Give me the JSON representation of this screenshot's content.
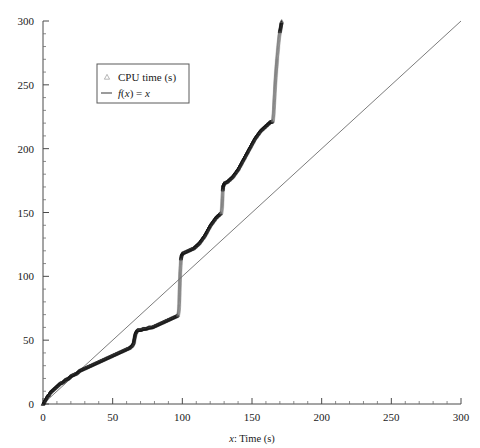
{
  "figure": {
    "background": "#ffffff",
    "plot_frame": {
      "left": 43,
      "right": 461,
      "top": 21,
      "bottom": 404
    }
  },
  "chart_data": {
    "type": "scatter",
    "title": "",
    "xlabel": "x: Time (s)",
    "ylabel": "",
    "xlim": [
      0,
      300
    ],
    "ylim": [
      0,
      300
    ],
    "xticks": [
      0,
      50,
      100,
      150,
      200,
      250,
      300
    ],
    "yticks": [
      0,
      50,
      100,
      150,
      200,
      250,
      300
    ],
    "xtick_labels": [
      "0",
      "50",
      "100",
      "150",
      "200",
      "250",
      "300"
    ],
    "ytick_labels": [
      "0",
      "50",
      "100",
      "150",
      "200",
      "250",
      "300"
    ],
    "minor_tick_step": 10,
    "grid": false,
    "legend_position": "upper left",
    "legend": [
      {
        "label": "CPU time (s)",
        "marker": "triangle",
        "color": "#6e6e6e"
      },
      {
        "label": "f(x) = x",
        "marker": "line",
        "color": "#4a4a4a"
      }
    ],
    "series": [
      {
        "name": "CPU time (s)",
        "marker": "triangle",
        "color": "#1a1a1a",
        "comment": "Staircase: slow accumulating segments separated by near-vertical jumps",
        "points": [
          [
            0,
            0
          ],
          [
            1,
            2
          ],
          [
            2,
            4
          ],
          [
            3,
            6
          ],
          [
            4,
            7
          ],
          [
            5,
            9
          ],
          [
            6,
            10
          ],
          [
            7,
            11
          ],
          [
            8,
            12
          ],
          [
            9,
            13
          ],
          [
            10,
            14
          ],
          [
            12,
            16
          ],
          [
            14,
            17
          ],
          [
            16,
            19
          ],
          [
            18,
            20
          ],
          [
            20,
            22
          ],
          [
            22,
            23
          ],
          [
            24,
            24
          ],
          [
            26,
            26
          ],
          [
            28,
            27
          ],
          [
            30,
            28
          ],
          [
            32,
            29
          ],
          [
            34,
            30
          ],
          [
            36,
            31
          ],
          [
            38,
            32
          ],
          [
            40,
            33
          ],
          [
            42,
            34
          ],
          [
            44,
            35
          ],
          [
            46,
            36
          ],
          [
            48,
            37
          ],
          [
            50,
            38
          ],
          [
            52,
            39
          ],
          [
            54,
            40
          ],
          [
            56,
            41
          ],
          [
            58,
            42
          ],
          [
            60,
            43
          ],
          [
            62,
            44
          ],
          [
            63,
            45
          ],
          [
            64,
            46
          ],
          [
            65,
            48
          ],
          [
            65.5,
            51
          ],
          [
            66,
            54
          ],
          [
            66.5,
            56
          ],
          [
            67,
            57
          ],
          [
            68,
            58
          ],
          [
            70,
            58
          ],
          [
            72,
            59
          ],
          [
            74,
            59
          ],
          [
            76,
            60
          ],
          [
            78,
            60
          ],
          [
            80,
            61
          ],
          [
            82,
            62
          ],
          [
            84,
            63
          ],
          [
            86,
            64
          ],
          [
            88,
            65
          ],
          [
            90,
            66
          ],
          [
            92,
            67
          ],
          [
            94,
            68
          ],
          [
            96,
            69
          ],
          [
            97,
            70
          ],
          [
            97.5,
            74
          ],
          [
            97.8,
            80
          ],
          [
            98,
            88
          ],
          [
            98.2,
            96
          ],
          [
            98.5,
            104
          ],
          [
            98.8,
            110
          ],
          [
            99,
            114
          ],
          [
            99.5,
            117
          ],
          [
            100,
            118
          ],
          [
            102,
            119
          ],
          [
            104,
            120
          ],
          [
            106,
            121
          ],
          [
            108,
            122
          ],
          [
            110,
            124
          ],
          [
            112,
            126
          ],
          [
            114,
            129
          ],
          [
            116,
            132
          ],
          [
            118,
            136
          ],
          [
            120,
            140
          ],
          [
            122,
            143
          ],
          [
            124,
            146
          ],
          [
            126,
            148
          ],
          [
            127,
            149
          ],
          [
            128,
            150
          ],
          [
            128.5,
            155
          ],
          [
            128.8,
            162
          ],
          [
            129,
            168
          ],
          [
            129.3,
            171
          ],
          [
            129.6,
            172
          ],
          [
            130,
            173
          ],
          [
            132,
            174
          ],
          [
            134,
            176
          ],
          [
            136,
            178
          ],
          [
            138,
            181
          ],
          [
            140,
            184
          ],
          [
            142,
            188
          ],
          [
            144,
            192
          ],
          [
            146,
            196
          ],
          [
            148,
            200
          ],
          [
            150,
            204
          ],
          [
            152,
            208
          ],
          [
            154,
            211
          ],
          [
            156,
            214
          ],
          [
            158,
            216
          ],
          [
            160,
            218
          ],
          [
            162,
            220
          ],
          [
            163,
            221
          ],
          [
            164,
            221
          ],
          [
            165,
            222
          ],
          [
            165.5,
            228
          ],
          [
            166,
            238
          ],
          [
            166.5,
            248
          ],
          [
            167,
            257
          ],
          [
            167.5,
            264
          ],
          [
            168,
            271
          ],
          [
            168.5,
            277
          ],
          [
            169,
            283
          ],
          [
            169.5,
            288
          ],
          [
            170,
            292
          ],
          [
            170.5,
            295
          ],
          [
            171,
            298
          ],
          [
            171.3,
            300
          ]
        ]
      },
      {
        "name": "f(x) = x",
        "marker": "line",
        "color": "#7c7c7c",
        "points": [
          [
            0,
            0
          ],
          [
            300,
            300
          ]
        ]
      }
    ]
  }
}
